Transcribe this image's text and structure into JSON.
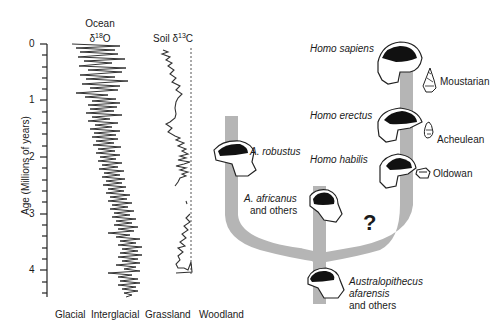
{
  "chart_data": [
    {
      "type": "line",
      "title": "Ocean δ18O",
      "title_line1": "Ocean",
      "title_line2": "δ18O",
      "ylabel": "Age (Millions of years)",
      "yticks": [
        "0",
        "1",
        "2",
        "3",
        "4"
      ],
      "ylim": [
        0,
        4.4
      ],
      "y_inverted": true,
      "xlabel_left": "Glacial",
      "xlabel_right": "Interglacial",
      "description": "Highly oscillating ocean oxygen isotope record; amplitude increases toward present, trend shifts toward glacial values younger than ~2.8 Ma",
      "series": [
        {
          "name": "Ocean δ18O",
          "age_ma": [
            0,
            0.5,
            1.0,
            1.5,
            2.0,
            2.5,
            3.0,
            3.5,
            4.0,
            4.4
          ],
          "relative_value_glacial0_interglacial1": [
            0.4,
            0.35,
            0.45,
            0.5,
            0.55,
            0.6,
            0.7,
            0.75,
            0.8,
            0.82
          ]
        }
      ]
    },
    {
      "type": "line",
      "title": "Soil δ13C",
      "xlabel_left": "Grassland",
      "xlabel_right": "Woodland",
      "reference_line": "dashed vertical line at woodland end",
      "description": "Soil carbon isotope record; near woodland before ~2 Ma, shifts toward grassland after ~1.8 Ma, gap between ~2.2 and ~2.8 Ma",
      "series": [
        {
          "name": "Soil δ13C",
          "age_ma": [
            0,
            0.3,
            0.7,
            1.0,
            1.3,
            1.6,
            1.8,
            2.6,
            3.0,
            3.5,
            4.0
          ],
          "relative_value_grassland0_woodland1": [
            0.2,
            0.35,
            0.55,
            0.5,
            0.25,
            0.55,
            0.5,
            0.7,
            0.6,
            0.4,
            0.9
          ]
        }
      ]
    }
  ],
  "tree": {
    "taxa": [
      {
        "name": "Homo sapiens",
        "italic": true
      },
      {
        "name": "Homo erectus",
        "italic": true
      },
      {
        "name": "Homo habilis",
        "italic": true
      },
      {
        "name": "A. robustus",
        "italic": true
      },
      {
        "name": "A. africanus",
        "italic": true,
        "suffix": "and others"
      },
      {
        "name": "Australopithecus",
        "name2": "afarensis",
        "italic": true,
        "suffix": "and others"
      }
    ],
    "tools": [
      "Moustarian",
      "Acheulean",
      "Oldowan"
    ],
    "uncertain_marker": "?"
  }
}
